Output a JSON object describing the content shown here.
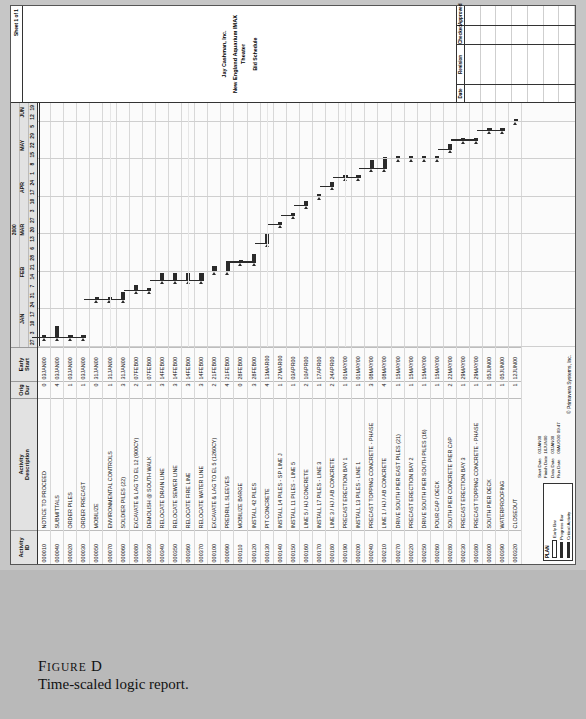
{
  "figure": {
    "label_prefix": "F",
    "label_rest": "IGURE",
    "label_letter": "D",
    "caption": "Time-scaled logic report."
  },
  "report": {
    "columns": {
      "id": "Activity\nID",
      "id_line1": "Activity",
      "id_line2": "ID",
      "desc_line1": "Activity",
      "desc_line2": "Description",
      "dur_line1": "Orig",
      "dur_line2": "Dur",
      "es_line1": "Early",
      "es_line2": "Start"
    },
    "timescale": {
      "year": "2000",
      "months": [
        "JAN",
        "FEB",
        "MAR",
        "APR",
        "MAY",
        "JUN"
      ],
      "days": [
        "27",
        "3",
        "10",
        "17",
        "24",
        "31",
        "7",
        "14",
        "21",
        "28",
        "6",
        "13",
        "20",
        "27",
        "3",
        "10",
        "17",
        "24",
        "1",
        "8",
        "15",
        "22",
        "29",
        "5",
        "12",
        "19"
      ]
    },
    "legend": {
      "title": "PLAN",
      "items": [
        {
          "label": "Early Bar",
          "style": "hollow"
        },
        {
          "label": "Progress Bar",
          "style": "solid"
        },
        {
          "label": "Critical Activity",
          "style": "solid"
        }
      ]
    },
    "dates": [
      {
        "label": "Start Date",
        "value": "03JAN00"
      },
      {
        "label": "Finish Date",
        "value": "16JUN00"
      },
      {
        "label": "Data Date",
        "value": "03JAN00"
      },
      {
        "label": "Run Date",
        "value": "09AUG00 09:47"
      }
    ],
    "copyright": "© Primavera Systems, Inc.",
    "rows": [
      {
        "id": "000010",
        "desc": "NOTICE TO PROCEED",
        "dur": "0",
        "es": "03JAN00"
      },
      {
        "id": "000040",
        "desc": "SUBMITTALS",
        "dur": "4",
        "es": "03JAN00"
      },
      {
        "id": "000020",
        "desc": "ORDER PILES",
        "dur": "1",
        "es": "03JAN00"
      },
      {
        "id": "000030",
        "desc": "ORDER PRECAST",
        "dur": "1",
        "es": "03JAN00"
      },
      {
        "id": "000050",
        "desc": "MOBILIZE",
        "dur": "0",
        "es": "31JAN00"
      },
      {
        "id": "000070",
        "desc": "ENVIRONMENTAL CONTROLS",
        "dur": "1",
        "es": "31JAN00"
      },
      {
        "id": "000060",
        "desc": "SOLDIER PILES (22)",
        "dur": "3",
        "es": "31JAN00"
      },
      {
        "id": "000080",
        "desc": "EXCAVATE & LAG TO EL  12 (900CY)",
        "dur": "2",
        "es": "07FEB00"
      },
      {
        "id": "000330",
        "desc": "DEMOLISH @ SOUTH WALK",
        "dur": "1",
        "es": "07FEB00"
      },
      {
        "id": "000340",
        "desc": "RELOCATE DRAIN LINE",
        "dur": "3",
        "es": "14FEB00"
      },
      {
        "id": "000350",
        "desc": "RELOCATE SEWER LINE",
        "dur": "3",
        "es": "14FEB00"
      },
      {
        "id": "000360",
        "desc": "RELOCATE FIRE LINE",
        "dur": "3",
        "es": "14FEB00"
      },
      {
        "id": "000370",
        "desc": "RELOCATE WATER LINE",
        "dur": "3",
        "es": "14FEB00"
      },
      {
        "id": "000100",
        "desc": "EXCAVATE & LAG TO EL 5 (1260CY)",
        "dur": "2",
        "es": "21FEB00"
      },
      {
        "id": "000090",
        "desc": "PREDRILL SLEEVES",
        "dur": "4",
        "es": "21FEB00"
      },
      {
        "id": "000110",
        "desc": "MOBILIZE BARGE",
        "dur": "0",
        "es": "28FEB00"
      },
      {
        "id": "000120",
        "desc": "INSTALL 42 PILES",
        "dur": "3",
        "es": "28FEB00"
      },
      {
        "id": "000130",
        "desc": "PIT CONCRETE",
        "dur": "4",
        "es": "13MAR00"
      },
      {
        "id": "000140",
        "desc": "INSTALL 14 PILES - SP LINE J",
        "dur": "1",
        "es": "27MAR00"
      },
      {
        "id": "000150",
        "desc": "INSTALL 11 PILES - LINE 5",
        "dur": "1",
        "es": "03APR00"
      },
      {
        "id": "000160",
        "desc": "LINE 5 / HJ CONCRETE",
        "dur": "2",
        "es": "10APR00"
      },
      {
        "id": "000170",
        "desc": "INSTALL 17 PILES - LINE 3",
        "dur": "1",
        "es": "17APR00"
      },
      {
        "id": "000180",
        "desc": "LINE 3 / HJ / AB CONCRETE",
        "dur": "2",
        "es": "24APR00"
      },
      {
        "id": "000190",
        "desc": "PRECAST ERECTION BAY 1",
        "dur": "1",
        "es": "01MAY00"
      },
      {
        "id": "000200",
        "desc": "INSTALL 13 PILES - LINE 1",
        "dur": "1",
        "es": "01MAY00"
      },
      {
        "id": "000240",
        "desc": "PRECAST TOPPING CONCRETE - PHASE",
        "dur": "3",
        "es": "08MAY00"
      },
      {
        "id": "000210",
        "desc": "LINE 1 / HJ / AB CONCRETE",
        "dur": "4",
        "es": "08MAY00"
      },
      {
        "id": "000270",
        "desc": "DRIVE SOUTH PIER EAST PILES (21)",
        "dur": "1",
        "es": "15MAY00"
      },
      {
        "id": "000220",
        "desc": "PRECAST ERECTION BAY 2",
        "dur": "1",
        "es": "15MAY00"
      },
      {
        "id": "000250",
        "desc": "DRIVE SOUTH PIER SOUTH PILES (16)",
        "dur": "1",
        "es": "15MAY00"
      },
      {
        "id": "000260",
        "desc": "POUR CAP / DECK",
        "dur": "1",
        "es": "15MAY00"
      },
      {
        "id": "000280",
        "desc": "SOUTH PIER CONCRETE PIER CAP",
        "dur": "2",
        "es": "22MAY00"
      },
      {
        "id": "000230",
        "desc": "PRECAST ERECTION BAY 3",
        "dur": "1",
        "es": "29MAY00"
      },
      {
        "id": "000380",
        "desc": "PRECAST TOPPING CONCRETE - PHASE",
        "dur": "1",
        "es": "29MAY00"
      },
      {
        "id": "000300",
        "desc": "SOUTH PIER DECK",
        "dur": "1",
        "es": "05JUN00"
      },
      {
        "id": "000390",
        "desc": "WATERPROOFING",
        "dur": "1",
        "es": "05JUN00"
      },
      {
        "id": "000320",
        "desc": "CLOSEOUT",
        "dur": "1",
        "es": "12JUN00"
      }
    ]
  },
  "titleblock": {
    "sheet": "Sheet 1 of 1",
    "client": "Jay Cashman, Inc.",
    "project": "New England Aquarium IMAX Theater",
    "subtitle": "Bid Schedule",
    "columns": [
      {
        "header": "Date"
      },
      {
        "header": "Revision"
      },
      {
        "header": "Checked"
      },
      {
        "header": "Approved"
      }
    ]
  },
  "chart_data": {
    "type": "bar",
    "title": "Time-scaled logic report",
    "xlabel": "",
    "ylabel": "",
    "x_axis_start": "27DEC99",
    "x_axis_end": "19JUN00",
    "bars": [
      {
        "id": "000010",
        "start_week": 1,
        "duration_weeks": 0
      },
      {
        "id": "000040",
        "start_week": 1,
        "duration_weeks": 4
      },
      {
        "id": "000020",
        "start_week": 1,
        "duration_weeks": 1
      },
      {
        "id": "000030",
        "start_week": 1,
        "duration_weeks": 1
      },
      {
        "id": "000050",
        "start_week": 5,
        "duration_weeks": 0
      },
      {
        "id": "000070",
        "start_week": 5,
        "duration_weeks": 1
      },
      {
        "id": "000060",
        "start_week": 5,
        "duration_weeks": 3
      },
      {
        "id": "000080",
        "start_week": 6,
        "duration_weeks": 2
      },
      {
        "id": "000330",
        "start_week": 6,
        "duration_weeks": 1
      },
      {
        "id": "000340",
        "start_week": 7,
        "duration_weeks": 3
      },
      {
        "id": "000350",
        "start_week": 7,
        "duration_weeks": 3
      },
      {
        "id": "000360",
        "start_week": 7,
        "duration_weeks": 3
      },
      {
        "id": "000370",
        "start_week": 7,
        "duration_weeks": 3
      },
      {
        "id": "000100",
        "start_week": 8,
        "duration_weeks": 2
      },
      {
        "id": "000090",
        "start_week": 8,
        "duration_weeks": 4
      },
      {
        "id": "000110",
        "start_week": 9,
        "duration_weeks": 0
      },
      {
        "id": "000120",
        "start_week": 9,
        "duration_weeks": 3
      },
      {
        "id": "000130",
        "start_week": 11,
        "duration_weeks": 4
      },
      {
        "id": "000140",
        "start_week": 13,
        "duration_weeks": 1
      },
      {
        "id": "000150",
        "start_week": 14,
        "duration_weeks": 1
      },
      {
        "id": "000160",
        "start_week": 15,
        "duration_weeks": 2
      },
      {
        "id": "000170",
        "start_week": 16,
        "duration_weeks": 1
      },
      {
        "id": "000180",
        "start_week": 17,
        "duration_weeks": 2
      },
      {
        "id": "000190",
        "start_week": 18,
        "duration_weeks": 1
      },
      {
        "id": "000200",
        "start_week": 18,
        "duration_weeks": 1
      },
      {
        "id": "000240",
        "start_week": 19,
        "duration_weeks": 3
      },
      {
        "id": "000210",
        "start_week": 19,
        "duration_weeks": 4
      },
      {
        "id": "000270",
        "start_week": 20,
        "duration_weeks": 1
      },
      {
        "id": "000220",
        "start_week": 20,
        "duration_weeks": 1
      },
      {
        "id": "000250",
        "start_week": 20,
        "duration_weeks": 1
      },
      {
        "id": "000260",
        "start_week": 20,
        "duration_weeks": 1
      },
      {
        "id": "000280",
        "start_week": 21,
        "duration_weeks": 2
      },
      {
        "id": "000230",
        "start_week": 22,
        "duration_weeks": 1
      },
      {
        "id": "000380",
        "start_week": 22,
        "duration_weeks": 1
      },
      {
        "id": "000300",
        "start_week": 23,
        "duration_weeks": 1
      },
      {
        "id": "000390",
        "start_week": 23,
        "duration_weeks": 1
      },
      {
        "id": "000320",
        "start_week": 24,
        "duration_weeks": 1
      }
    ]
  }
}
